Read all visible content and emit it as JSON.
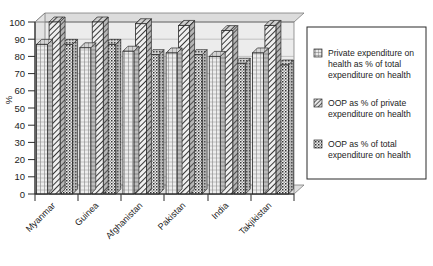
{
  "chart_data": {
    "type": "bar",
    "title": "",
    "xlabel": "",
    "ylabel": "%",
    "ylim": [
      0,
      100
    ],
    "yticks": [
      0,
      10,
      20,
      30,
      40,
      50,
      60,
      70,
      80,
      90,
      100
    ],
    "grid": true,
    "legend_position": "right",
    "categories": [
      "Myanmar",
      "Guinea",
      "Afghanistan",
      "Pakistan",
      "India",
      "Takjikistan"
    ],
    "series": [
      {
        "name": "Private expenditure on health as % of total expenditure on health",
        "pattern": "vertical-grid",
        "values": [
          87,
          85,
          83,
          82,
          80,
          82
        ]
      },
      {
        "name": "OOP as % of private expenditure on health",
        "pattern": "diagonal-hatch",
        "values": [
          100,
          100,
          99,
          98,
          95,
          98
        ]
      },
      {
        "name": "OOP as % of total expenditure on health",
        "pattern": "dotted-check",
        "values": [
          87,
          87,
          81,
          81,
          76,
          75
        ]
      }
    ]
  },
  "axis": {
    "y_title": "%",
    "tick_labels": [
      "100",
      "90",
      "80",
      "70",
      "60",
      "50",
      "40",
      "30",
      "20",
      "10",
      "0"
    ]
  },
  "legend": {
    "entries": [
      {
        "label": "Private expenditure on health as % of total expenditure on health",
        "swatch": "vertical-grid-swatch"
      },
      {
        "label": "OOP as % of private expenditure on health",
        "swatch": "diagonal-hatch-swatch"
      },
      {
        "label": "OOP as % of total expenditure on health",
        "swatch": "dotted-check-swatch"
      }
    ]
  },
  "colors": {
    "plot_background": "#ececec",
    "wall_top": "#dcdcdc",
    "bar_light": "#e8e8e8",
    "bar_outline": "#2b2b2b",
    "grid": "#a8a8a8",
    "axis": "#2b2b2b",
    "legend_border": "#2b2b2b"
  }
}
